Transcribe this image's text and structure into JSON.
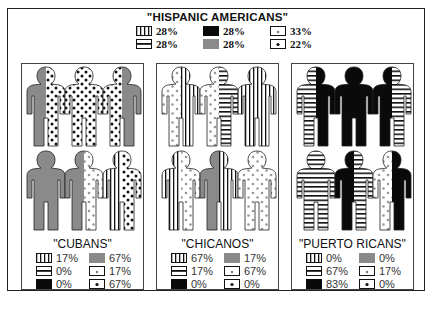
{
  "title": "\"HISPANIC AMERICANS\"",
  "colors": {
    "gray": "#8a8a8a",
    "black": "#0a0a0a",
    "white": "#ffffff",
    "ink": "#111111"
  },
  "legend_patterns": {
    "vstripes": "vertical-stripes-pattern",
    "hstripes": "horizontal-stripes-pattern",
    "black": "solid-black",
    "gray": "solid-gray",
    "lightdots": "light-dots-pattern",
    "dots": "dark-dots-pattern"
  },
  "overall": {
    "vstripes": "28%",
    "hstripes": "28%",
    "black": "28%",
    "gray": "28%",
    "lightdots": "33%",
    "dots": "22%"
  },
  "panels": [
    {
      "name": "\"CUBANS\"",
      "figures": [
        [
          "gray",
          "dots"
        ],
        [
          "dots",
          "dots"
        ],
        [
          "dots",
          "gray"
        ],
        [
          "gray",
          "gray"
        ],
        [
          "gray",
          "lightdots"
        ],
        [
          "vstripes",
          "dots"
        ]
      ],
      "legend": {
        "vstripes": "17%",
        "hstripes": "0%",
        "black": "0%",
        "gray": "67%",
        "lightdots": "17%",
        "dots": "67%"
      }
    },
    {
      "name": "\"CHICANOS\"",
      "figures": [
        [
          "lightdots",
          "vstripes"
        ],
        [
          "lightdots",
          "hstripes"
        ],
        [
          "vstripes",
          "vstripes"
        ],
        [
          "vstripes",
          "lightdots"
        ],
        [
          "gray",
          "vstripes"
        ],
        [
          "lightdots",
          "lightdots"
        ]
      ],
      "legend": {
        "vstripes": "67%",
        "hstripes": "17%",
        "black": "0%",
        "gray": "17%",
        "lightdots": "67%",
        "dots": "0%"
      }
    },
    {
      "name": "\"PUERTO RICANS\"",
      "figures": [
        [
          "hstripes",
          "black"
        ],
        [
          "black",
          "black"
        ],
        [
          "black",
          "hstripes"
        ],
        [
          "hstripes",
          "hstripes"
        ],
        [
          "black",
          "hstripes"
        ],
        [
          "lightdots",
          "black"
        ]
      ],
      "legend": {
        "vstripes": "0%",
        "hstripes": "67%",
        "black": "83%",
        "gray": "0%",
        "lightdots": "17%",
        "dots": "0%"
      }
    }
  ]
}
